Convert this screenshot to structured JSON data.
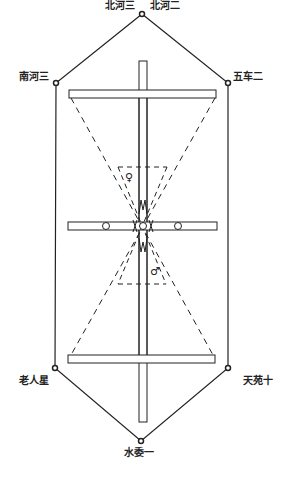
{
  "diagram": {
    "type": "constellation-loom-diagram",
    "stars": {
      "top_left": "北河三",
      "top_right": "北河二",
      "upper_left": "南河三",
      "upper_right": "五车二",
      "lower_left": "老人星",
      "lower_right": "天苑十",
      "bottom": "水委一"
    },
    "symbols": {
      "female": "♀",
      "male": "♂"
    },
    "colors": {
      "line": "#222222",
      "background": "#ffffff"
    }
  }
}
